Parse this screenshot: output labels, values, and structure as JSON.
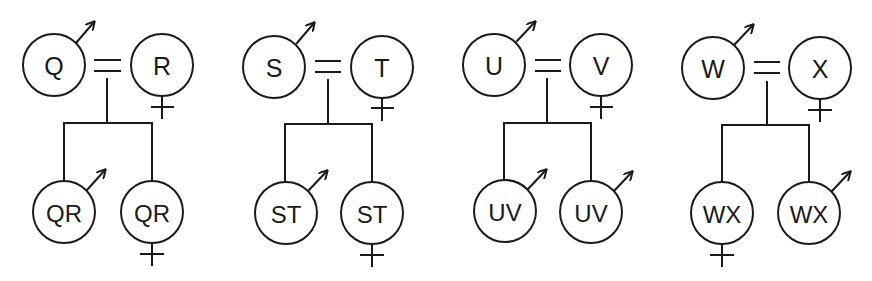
{
  "diagram": {
    "type": "pedigree",
    "stroke_color": "#1a1a1a",
    "background": "#ffffff",
    "families": [
      {
        "id": "family-q-r",
        "father": {
          "label": "Q",
          "sex": "male",
          "cx": 54,
          "cy": 65
        },
        "mother": {
          "label": "R",
          "sex": "female",
          "cx": 162,
          "cy": 65
        },
        "marriage": {
          "x1": 95,
          "x2": 120,
          "y1": 60,
          "y2": 71,
          "stem_x": 107
        },
        "sibship_bar": {
          "y": 123
        },
        "children": [
          {
            "label": "QR",
            "sex": "male",
            "cx": 64,
            "cy": 212
          },
          {
            "label": "QR",
            "sex": "female",
            "cx": 152,
            "cy": 212
          }
        ]
      },
      {
        "id": "family-s-t",
        "father": {
          "label": "S",
          "sex": "male",
          "cx": 274,
          "cy": 67
        },
        "mother": {
          "label": "T",
          "sex": "female",
          "cx": 382,
          "cy": 67
        },
        "marriage": {
          "x1": 316,
          "x2": 340,
          "y1": 61,
          "y2": 72,
          "stem_x": 328
        },
        "sibship_bar": {
          "y": 124
        },
        "children": [
          {
            "label": "ST",
            "sex": "male",
            "cx": 286,
            "cy": 213
          },
          {
            "label": "ST",
            "sex": "female",
            "cx": 372,
            "cy": 213
          }
        ]
      },
      {
        "id": "family-u-v",
        "father": {
          "label": "U",
          "sex": "male",
          "cx": 494,
          "cy": 65
        },
        "mother": {
          "label": "V",
          "sex": "female",
          "cx": 601,
          "cy": 65
        },
        "marriage": {
          "x1": 536,
          "x2": 560,
          "y1": 60,
          "y2": 71,
          "stem_x": 547
        },
        "sibship_bar": {
          "y": 123
        },
        "children": [
          {
            "label": "UV",
            "sex": "male",
            "cx": 505,
            "cy": 211
          },
          {
            "label": "UV",
            "sex": "male",
            "cx": 591,
            "cy": 212
          }
        ]
      },
      {
        "id": "family-w-x",
        "father": {
          "label": "W",
          "sex": "male",
          "cx": 713,
          "cy": 68
        },
        "mother": {
          "label": "X",
          "sex": "female",
          "cx": 820,
          "cy": 68
        },
        "marriage": {
          "x1": 755,
          "x2": 779,
          "y1": 62,
          "y2": 73,
          "stem_x": 767
        },
        "sibship_bar": {
          "y": 125
        },
        "children": [
          {
            "label": "WX",
            "sex": "female",
            "cx": 722,
            "cy": 213
          },
          {
            "label": "WX",
            "sex": "male",
            "cx": 809,
            "cy": 213
          }
        ]
      }
    ]
  },
  "labels": {
    "f0_father": "Q",
    "f0_mother": "R",
    "f0_child0": "QR",
    "f0_child1": "QR",
    "f1_father": "S",
    "f1_mother": "T",
    "f1_child0": "ST",
    "f1_child1": "ST",
    "f2_father": "U",
    "f2_mother": "V",
    "f2_child0": "UV",
    "f2_child1": "UV",
    "f3_father": "W",
    "f3_mother": "X",
    "f3_child0": "WX",
    "f3_child1": "WX"
  }
}
